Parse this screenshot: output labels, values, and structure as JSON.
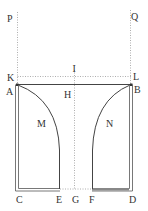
{
  "diagram": {
    "type": "geometric-construction",
    "labels": {
      "P": "P",
      "Q": "Q",
      "K": "K",
      "L": "L",
      "I": "I",
      "A": "A",
      "B": "B",
      "H": "H",
      "M": "M",
      "N": "N",
      "C": "C",
      "E": "E",
      "G": "G",
      "F": "F",
      "D": "D"
    },
    "colors": {
      "solid_line": "#444444",
      "dotted_line": "#999999",
      "thick_segment": "#888888",
      "label": "#333333"
    }
  }
}
